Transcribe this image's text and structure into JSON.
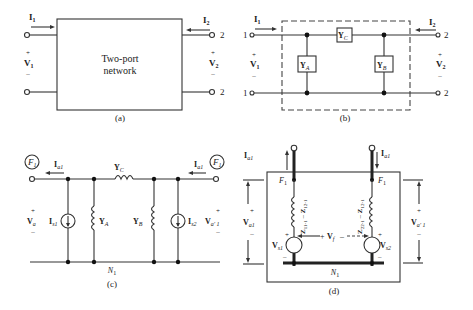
{
  "figure": {
    "panels": {
      "a": {
        "caption": "(a)",
        "block_line1": "Two-port",
        "block_line2": "network",
        "i1": "I",
        "i1_sub": "1",
        "i2": "I",
        "i2_sub": "2",
        "v1": "V",
        "v1_sub": "1",
        "v2": "V",
        "v2_sub": "2",
        "plus": "+",
        "minus": "–",
        "port2_top": "2",
        "port2_bottom": "2"
      },
      "b": {
        "caption": "(b)",
        "i1": "I",
        "i1_sub": "1",
        "i2": "I",
        "i2_sub": "2",
        "v1": "V",
        "v1_sub": "1",
        "v2": "V",
        "v2_sub": "2",
        "plus": "+",
        "minus": "–",
        "port1_top": "1",
        "port1_bottom": "1",
        "port2_top": "2",
        "port2_bottom": "2",
        "ya": "Y",
        "ya_sub": "A",
        "yb": "Y",
        "yb_sub": "B",
        "yc": "Y",
        "yc_sub": "C"
      },
      "c": {
        "caption": "(c)",
        "f_left": "F",
        "f_left_sub": "1",
        "f_right": "F",
        "f_right_sub": "1",
        "ia_left": "I",
        "ia_left_sub": "a1",
        "ia_right": "I",
        "ia_right_sub": "a1",
        "yc": "Y",
        "yc_sub": "C",
        "ya": "Y",
        "ya_sub": "A",
        "yb": "Y",
        "yb_sub": "B",
        "is1": "I",
        "is1_sub": "s1",
        "is2": "I",
        "is2_sub": "s2",
        "va": "V",
        "va_sub": "a",
        "va_right": "V",
        "va_right_sub": "a′ 1",
        "n1": "N",
        "n1_sub": "1",
        "plus": "+",
        "minus": "–"
      },
      "d": {
        "caption": "(d)",
        "ia_left": "I",
        "ia_left_sub": "a1",
        "ia_right": "I",
        "ia_right_sub": "a1",
        "f_left": "F",
        "f_left_sub": "1",
        "f_right": "F",
        "f_right_sub": "1",
        "z_left": "Z",
        "z_left_sub1": "11-1",
        "z_left_mid": " – ",
        "z_left_z2": "Z",
        "z_left_sub2": "12-1",
        "z_right": "Z",
        "z_right_sub1": "22-1",
        "z_right_mid": " – ",
        "z_right_z2": "Z",
        "z_right_sub2": "12-1",
        "vf": "V",
        "vf_sub": "f",
        "vs1": "V",
        "vs1_sub": "s1",
        "vs2": "V",
        "vs2_sub": "s2",
        "va1": "V",
        "va1_sub": "a1",
        "va_right": "V",
        "va_right_sub": "a′ 1",
        "n1": "N",
        "n1_sub": "1",
        "plus": "+",
        "minus": "–"
      }
    }
  }
}
